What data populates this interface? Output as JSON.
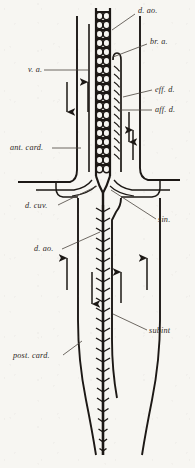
{
  "figure": {
    "background_color": "#f7f6f2",
    "ink_color": "#1c1815",
    "labels": [
      {
        "id": "d-ao-top",
        "text": "d. ao.",
        "x": 138,
        "y": 13,
        "leader": [
          [
            135,
            14
          ],
          [
            112,
            30
          ]
        ]
      },
      {
        "id": "br-a",
        "text": "br. a.",
        "x": 150,
        "y": 44,
        "leader": [
          [
            147,
            44
          ],
          [
            113,
            57
          ]
        ]
      },
      {
        "id": "v-a",
        "text": "v. a.",
        "x": 28,
        "y": 72,
        "leader": [
          [
            44,
            70
          ],
          [
            89,
            70
          ]
        ]
      },
      {
        "id": "eff-d",
        "text": "eff. d.",
        "x": 155,
        "y": 92,
        "leader": [
          [
            152,
            90
          ],
          [
            123,
            97
          ]
        ]
      },
      {
        "id": "aff-d",
        "text": "aff. d.",
        "x": 155,
        "y": 112,
        "leader": [
          [
            152,
            110
          ],
          [
            119,
            110
          ]
        ]
      },
      {
        "id": "ant-card",
        "text": "ant. card.",
        "x": 10,
        "y": 150,
        "leader": [
          [
            52,
            148
          ],
          [
            81,
            148
          ]
        ]
      },
      {
        "id": "d-cuv",
        "text": "d. cuv.",
        "x": 25,
        "y": 208,
        "leader": [
          [
            58,
            205
          ],
          [
            97,
            186
          ]
        ]
      },
      {
        "id": "sin",
        "text": "sin.",
        "x": 158,
        "y": 222,
        "leader": [
          [
            156,
            219
          ],
          [
            111,
            190
          ]
        ]
      },
      {
        "id": "d-ao-lower",
        "text": "d. ao.",
        "x": 34,
        "y": 251,
        "leader": [
          [
            62,
            249
          ],
          [
            100,
            232
          ]
        ]
      },
      {
        "id": "subint",
        "text": "subint",
        "x": 149,
        "y": 333,
        "leader": [
          [
            147,
            330
          ],
          [
            113,
            314
          ]
        ]
      },
      {
        "id": "post-card",
        "text": "post. card.",
        "x": 13,
        "y": 358,
        "leader": [
          [
            63,
            355
          ],
          [
            82,
            341
          ]
        ]
      }
    ],
    "flow_arrows": [
      {
        "id": "arrow-ant-card-left",
        "x": 67,
        "y1": 82,
        "y2": 112,
        "direction": "down"
      },
      {
        "id": "arrow-ventral-aorta",
        "x": 88,
        "y1": 112,
        "y2": 82,
        "direction": "up"
      },
      {
        "id": "arrow-aff-branchial",
        "x": 129,
        "y1": 112,
        "y2": 142,
        "direction": "down"
      },
      {
        "id": "arrow-eff-branchial",
        "x": 133,
        "y1": 160,
        "y2": 130,
        "direction": "up"
      },
      {
        "id": "arrow-post-card-left",
        "x": 67,
        "y1": 290,
        "y2": 258,
        "direction": "up"
      },
      {
        "id": "arrow-dorsal-aorta",
        "x": 92,
        "y1": 272,
        "y2": 304,
        "direction": "down"
      },
      {
        "id": "arrow-subintestinal",
        "x": 121,
        "y1": 303,
        "y2": 272,
        "direction": "up"
      },
      {
        "id": "arrow-post-card-right",
        "x": 147,
        "y1": 290,
        "y2": 258,
        "direction": "up"
      }
    ],
    "vessels": [
      {
        "id": "dorsal-aorta-cranial",
        "name": "dorsal aorta (cranial, segmented)"
      },
      {
        "id": "branchial-arches",
        "name": "branchial arch / gill loop"
      },
      {
        "id": "ventral-aorta",
        "name": "ventral aorta"
      },
      {
        "id": "anterior-cardinal",
        "name": "anterior cardinal vein"
      },
      {
        "id": "duct-of-cuvier",
        "name": "duct of Cuvier"
      },
      {
        "id": "sinus-venosus",
        "name": "sinus venosus"
      },
      {
        "id": "dorsal-aorta-caudal",
        "name": "dorsal aorta (caudal, segmented)"
      },
      {
        "id": "subintestinal-vein",
        "name": "subintestinal vein"
      },
      {
        "id": "posterior-cardinal",
        "name": "posterior cardinal vein"
      }
    ]
  }
}
